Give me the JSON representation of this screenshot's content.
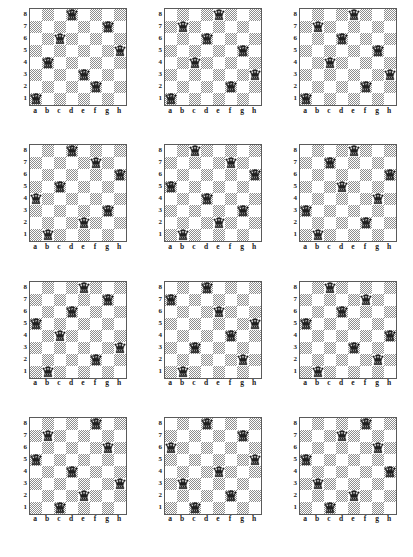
{
  "page": {
    "board_count": 12,
    "board_size": 8,
    "piece_name": "queen",
    "colors": {
      "light_square": "#ffffff",
      "dark_square": "#8d8d8d",
      "border": "#5a5a5a",
      "label_text": "#1a1a1a",
      "page_background": "#ffffff"
    }
  },
  "labels": {
    "files": [
      "a",
      "b",
      "c",
      "d",
      "e",
      "f",
      "g",
      "h"
    ],
    "ranks": [
      "8",
      "7",
      "6",
      "5",
      "4",
      "3",
      "2",
      "1"
    ]
  },
  "boards": [
    {
      "index": 1,
      "queens": [
        "d8",
        "g7",
        "c6",
        "h5",
        "b4",
        "e3",
        "f2",
        "a1"
      ],
      "columns_by_rank_desc": [
        4,
        7,
        3,
        8,
        2,
        5,
        6,
        1
      ]
    },
    {
      "index": 2,
      "queens": [
        "e8",
        "b7",
        "d6",
        "g5",
        "c4",
        "h3",
        "f2",
        "a1"
      ],
      "columns_by_rank_desc": [
        5,
        2,
        4,
        7,
        3,
        8,
        6,
        1
      ]
    },
    {
      "index": 3,
      "queens": [
        "e8",
        "b7",
        "d6",
        "g5",
        "c4",
        "h3",
        "f2",
        "a1"
      ],
      "columns_by_rank_desc": [
        5,
        2,
        4,
        7,
        3,
        8,
        6,
        1
      ]
    },
    {
      "index": 4,
      "queens": [
        "d8",
        "f7",
        "h6",
        "c5",
        "a4",
        "g3",
        "e2",
        "b1"
      ],
      "columns_by_rank_desc": [
        4,
        6,
        8,
        3,
        1,
        7,
        5,
        2
      ]
    },
    {
      "index": 5,
      "queens": [
        "c8",
        "f7",
        "h6",
        "a5",
        "d4",
        "g3",
        "e2",
        "b1"
      ],
      "columns_by_rank_desc": [
        3,
        6,
        8,
        1,
        4,
        7,
        5,
        2
      ]
    },
    {
      "index": 6,
      "queens": [
        "e8",
        "c7",
        "h6",
        "d5",
        "g4",
        "a3",
        "f2",
        "b1"
      ],
      "columns_by_rank_desc": [
        5,
        3,
        8,
        4,
        7,
        1,
        6,
        2
      ]
    },
    {
      "index": 7,
      "queens": [
        "e8",
        "g7",
        "d6",
        "a5",
        "c4",
        "h3",
        "f2",
        "b1"
      ],
      "columns_by_rank_desc": [
        5,
        7,
        4,
        1,
        3,
        8,
        6,
        2
      ]
    },
    {
      "index": 8,
      "queens": [
        "d8",
        "a7",
        "e6",
        "h5",
        "f4",
        "c3",
        "g2",
        "b1"
      ],
      "columns_by_rank_desc": [
        4,
        1,
        5,
        8,
        6,
        3,
        7,
        2
      ]
    },
    {
      "index": 9,
      "queens": [
        "c8",
        "f7",
        "d6",
        "a5",
        "h4",
        "e3",
        "g2",
        "b1"
      ],
      "columns_by_rank_desc": [
        3,
        6,
        4,
        1,
        8,
        5,
        7,
        2
      ]
    },
    {
      "index": 10,
      "queens": [
        "f8",
        "b7",
        "g6",
        "a5",
        "d4",
        "h3",
        "e2",
        "c1"
      ],
      "columns_by_rank_desc": [
        6,
        2,
        7,
        1,
        4,
        8,
        5,
        3
      ]
    },
    {
      "index": 11,
      "queens": [
        "d8",
        "g7",
        "a6",
        "h5",
        "e4",
        "b3",
        "f2",
        "c1"
      ],
      "columns_by_rank_desc": [
        4,
        7,
        1,
        8,
        5,
        2,
        6,
        3
      ]
    },
    {
      "index": 12,
      "queens": [
        "f8",
        "d7",
        "g6",
        "a5",
        "h4",
        "b3",
        "e2",
        "c1"
      ],
      "columns_by_rank_desc": [
        6,
        4,
        7,
        1,
        8,
        2,
        5,
        3
      ]
    }
  ]
}
